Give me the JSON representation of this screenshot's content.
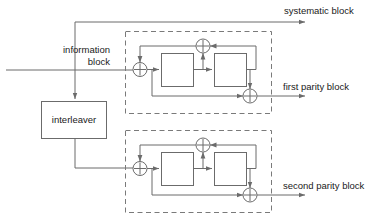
{
  "diagram": {
    "colors": {
      "line": "#6b6b6b",
      "dashed": "#7a7a7a",
      "text": "#1a1a1a",
      "background": "#ffffff"
    },
    "labels": {
      "information_block": "information\nblock",
      "information_block_line1": "information",
      "information_block_line2": "block",
      "interleaver": "interleaver",
      "systematic_block": "systematic block",
      "first_parity_block": "first parity block",
      "second_parity_block": "second parity block"
    },
    "components": {
      "interleaver_block": "interleaver",
      "upper_encoder": "first constituent encoder",
      "lower_encoder": "second constituent encoder",
      "adder_symbol": "+",
      "delay_element": "",
      "xor_count_per_encoder": 3,
      "delay_count_per_encoder": 2
    },
    "outputs": [
      "systematic block",
      "first parity block",
      "second parity block"
    ],
    "inputs": [
      "information block"
    ]
  }
}
